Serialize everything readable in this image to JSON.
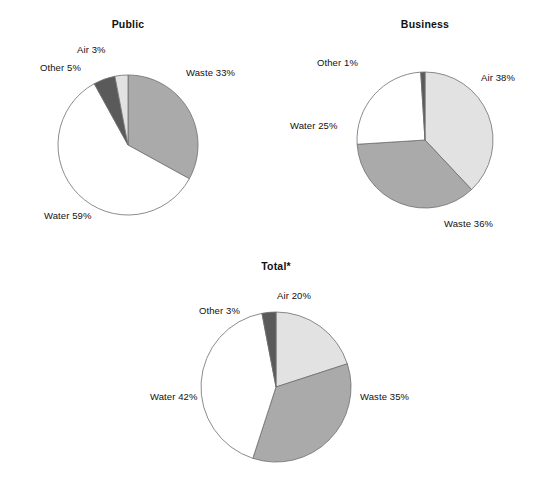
{
  "figure": {
    "background_color": "#ffffff",
    "charts": [
      {
        "id": "public",
        "title": "Public",
        "labels": [
          {
            "name": "waste",
            "text": "Waste 33%"
          },
          {
            "name": "water",
            "text": "Water 59%"
          },
          {
            "name": "other",
            "text": "Other 5%"
          },
          {
            "name": "air",
            "text": "Air 3%"
          }
        ]
      },
      {
        "id": "business",
        "title": "Business",
        "labels": [
          {
            "name": "air",
            "text": "Air 38%"
          },
          {
            "name": "waste",
            "text": "Waste 36%"
          },
          {
            "name": "water",
            "text": "Water 25%"
          },
          {
            "name": "other",
            "text": "Other 1%"
          }
        ]
      },
      {
        "id": "total",
        "title": "Total*",
        "labels": [
          {
            "name": "air",
            "text": "Air 20%"
          },
          {
            "name": "waste",
            "text": "Waste 35%"
          },
          {
            "name": "water",
            "text": "Water 42%"
          },
          {
            "name": "other",
            "text": "Other 3%"
          }
        ]
      }
    ]
  },
  "colors": {
    "air": "#e2e2e2",
    "waste": "#aaaaaa",
    "water": "#ffffff",
    "other": "#5a5a5a",
    "outline": "#6e6e6e",
    "text": "#111111"
  },
  "chart_data": [
    {
      "type": "pie",
      "title": "Public",
      "categories": [
        "Waste",
        "Water",
        "Other",
        "Air"
      ],
      "values": [
        33,
        59,
        5,
        3
      ],
      "labels": [
        "Waste 33%",
        "Water 59%",
        "Other 5%",
        "Air 3%"
      ],
      "units": "percent",
      "start_angle_deg": 0,
      "direction": "clockwise",
      "legend": "none",
      "grid": false,
      "slice_colors": [
        "#aaaaaa",
        "#ffffff",
        "#5a5a5a",
        "#e2e2e2"
      ]
    },
    {
      "type": "pie",
      "title": "Business",
      "categories": [
        "Air",
        "Waste",
        "Water",
        "Other"
      ],
      "values": [
        38,
        36,
        25,
        1
      ],
      "labels": [
        "Air 38%",
        "Waste 36%",
        "Water 25%",
        "Other 1%"
      ],
      "units": "percent",
      "start_angle_deg": 0,
      "direction": "clockwise",
      "legend": "none",
      "grid": false,
      "slice_colors": [
        "#e2e2e2",
        "#aaaaaa",
        "#ffffff",
        "#5a5a5a"
      ]
    },
    {
      "type": "pie",
      "title": "Total*",
      "categories": [
        "Air",
        "Waste",
        "Water",
        "Other"
      ],
      "values": [
        20,
        35,
        42,
        3
      ],
      "labels": [
        "Air 20%",
        "Waste 35%",
        "Water 42%",
        "Other 3%"
      ],
      "units": "percent",
      "start_angle_deg": 0,
      "direction": "clockwise",
      "legend": "none",
      "grid": false,
      "slice_colors": [
        "#e2e2e2",
        "#aaaaaa",
        "#ffffff",
        "#5a5a5a"
      ]
    }
  ]
}
